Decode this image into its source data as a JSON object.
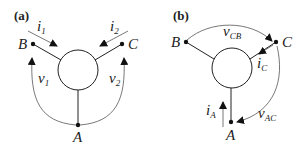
{
  "panels": [
    {
      "tag": "(a)",
      "nodes": {
        "B": "B",
        "C": "C",
        "A": "A"
      },
      "currents": [
        {
          "base": "i",
          "sub": "1"
        },
        {
          "base": "i",
          "sub": "2"
        }
      ],
      "voltages": [
        {
          "base": "v",
          "sub": "1"
        },
        {
          "base": "v",
          "sub": "2"
        }
      ]
    },
    {
      "tag": "(b)",
      "nodes": {
        "B": "B",
        "C": "C",
        "A": "A"
      },
      "currents": [
        {
          "base": "i",
          "sub": "C"
        },
        {
          "base": "i",
          "sub": "A"
        }
      ],
      "voltages": [
        {
          "base": "v",
          "sub": "CB"
        },
        {
          "base": "v",
          "sub": "AC"
        }
      ]
    }
  ],
  "colors": {
    "line": "#222222",
    "thin": "#555555"
  }
}
